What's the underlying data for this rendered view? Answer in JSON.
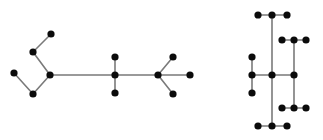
{
  "figure": {
    "background_color": "#ffffff",
    "node_color": "#0b0b0b",
    "edge_color": "#7a7a7a",
    "node_radius": 3.6,
    "edge_width": 1.6,
    "width": 323,
    "height": 140
  },
  "graphs": [
    {
      "name": "left-graph",
      "label": "Left tree",
      "node_count": 12,
      "edge_count": 11,
      "nodes": [
        {
          "id": "L0",
          "x": 14,
          "y": 73
        },
        {
          "id": "L1",
          "x": 33,
          "y": 94
        },
        {
          "id": "L2",
          "x": 50,
          "y": 75
        },
        {
          "id": "L3",
          "x": 33,
          "y": 52
        },
        {
          "id": "L4",
          "x": 51,
          "y": 34
        },
        {
          "id": "L5",
          "x": 115,
          "y": 57
        },
        {
          "id": "L6",
          "x": 115,
          "y": 75
        },
        {
          "id": "L7",
          "x": 115,
          "y": 93
        },
        {
          "id": "L8",
          "x": 158,
          "y": 75
        },
        {
          "id": "L9",
          "x": 173,
          "y": 57
        },
        {
          "id": "L10",
          "x": 190,
          "y": 75
        },
        {
          "id": "L11",
          "x": 173,
          "y": 94
        }
      ],
      "edges": [
        {
          "from": "L0",
          "to": "L1"
        },
        {
          "from": "L1",
          "to": "L2"
        },
        {
          "from": "L2",
          "to": "L3"
        },
        {
          "from": "L3",
          "to": "L4"
        },
        {
          "from": "L2",
          "to": "L6"
        },
        {
          "from": "L5",
          "to": "L6"
        },
        {
          "from": "L6",
          "to": "L7"
        },
        {
          "from": "L6",
          "to": "L8"
        },
        {
          "from": "L8",
          "to": "L9"
        },
        {
          "from": "L8",
          "to": "L10"
        },
        {
          "from": "L8",
          "to": "L11"
        }
      ]
    },
    {
      "name": "right-graph",
      "label": "Right tree",
      "node_count": 17,
      "edge_count": 16,
      "nodes": [
        {
          "id": "R0",
          "x": 258,
          "y": 15
        },
        {
          "id": "R1",
          "x": 272,
          "y": 15
        },
        {
          "id": "R2",
          "x": 287,
          "y": 15
        },
        {
          "id": "R3",
          "x": 282,
          "y": 40
        },
        {
          "id": "R4",
          "x": 294,
          "y": 40
        },
        {
          "id": "R5",
          "x": 306,
          "y": 40
        },
        {
          "id": "R6",
          "x": 252,
          "y": 57
        },
        {
          "id": "R7",
          "x": 252,
          "y": 75
        },
        {
          "id": "R8",
          "x": 252,
          "y": 93
        },
        {
          "id": "R9",
          "x": 272,
          "y": 75
        },
        {
          "id": "R10",
          "x": 294,
          "y": 75
        },
        {
          "id": "R11",
          "x": 282,
          "y": 108
        },
        {
          "id": "R12",
          "x": 294,
          "y": 108
        },
        {
          "id": "R13",
          "x": 306,
          "y": 108
        },
        {
          "id": "R14",
          "x": 258,
          "y": 126
        },
        {
          "id": "R15",
          "x": 272,
          "y": 126
        },
        {
          "id": "R16",
          "x": 287,
          "y": 126
        }
      ],
      "edges": [
        {
          "from": "R0",
          "to": "R1"
        },
        {
          "from": "R1",
          "to": "R2"
        },
        {
          "from": "R1",
          "to": "R9"
        },
        {
          "from": "R3",
          "to": "R4"
        },
        {
          "from": "R4",
          "to": "R5"
        },
        {
          "from": "R4",
          "to": "R10"
        },
        {
          "from": "R6",
          "to": "R7"
        },
        {
          "from": "R7",
          "to": "R8"
        },
        {
          "from": "R7",
          "to": "R9"
        },
        {
          "from": "R9",
          "to": "R10"
        },
        {
          "from": "R9",
          "to": "R15"
        },
        {
          "from": "R10",
          "to": "R12"
        },
        {
          "from": "R11",
          "to": "R12"
        },
        {
          "from": "R12",
          "to": "R13"
        },
        {
          "from": "R14",
          "to": "R15"
        },
        {
          "from": "R15",
          "to": "R16"
        }
      ]
    }
  ]
}
